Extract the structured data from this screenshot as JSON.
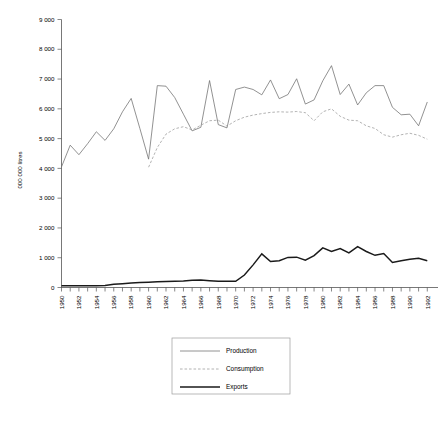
{
  "chart_data": {
    "type": "line",
    "title": "",
    "xlabel": "",
    "ylabel": "000 000 litres",
    "ylim": [
      0,
      9000
    ],
    "xlim": [
      1950,
      1993
    ],
    "grid": false,
    "legend_position": "bottom-center",
    "ytick_labels": [
      "0",
      "1 000",
      "2 000",
      "3 000",
      "4 000",
      "5 000",
      "6 000",
      "7 000",
      "8 000",
      "9 000"
    ],
    "ytick_values": [
      0,
      1000,
      2000,
      3000,
      4000,
      5000,
      6000,
      7000,
      8000,
      9000
    ],
    "xtick_labels": [
      "1950",
      "1951",
      "1952",
      "1953",
      "1954",
      "1955",
      "1956",
      "1957",
      "1958",
      "1959",
      "1960",
      "1961",
      "1962",
      "1963",
      "1964",
      "1965",
      "1966",
      "1967",
      "1968",
      "1969",
      "1970",
      "1971",
      "1972",
      "1973",
      "1974",
      "1975",
      "1976",
      "1977",
      "1978",
      "1979",
      "1980",
      "1981",
      "1982",
      "1983",
      "1984",
      "1985",
      "1986",
      "1987",
      "1988",
      "1989",
      "1990",
      "1991",
      "1992"
    ],
    "xtick_labels_shown": [
      "1950",
      "1952",
      "1954",
      "1956",
      "1958",
      "1960",
      "1962",
      "1964",
      "1966",
      "1968",
      "1970",
      "1972",
      "1974",
      "1976",
      "1978",
      "1980",
      "1982",
      "1984",
      "1986",
      "1988",
      "1990",
      "1992"
    ],
    "x": [
      1950,
      1951,
      1952,
      1953,
      1954,
      1955,
      1956,
      1957,
      1958,
      1959,
      1960,
      1961,
      1962,
      1963,
      1964,
      1965,
      1966,
      1967,
      1968,
      1969,
      1970,
      1971,
      1972,
      1973,
      1974,
      1975,
      1976,
      1977,
      1978,
      1979,
      1980,
      1981,
      1982,
      1983,
      1984,
      1985,
      1986,
      1987,
      1988,
      1989,
      1990,
      1991,
      1992
    ],
    "series": [
      {
        "name": "Production",
        "style": "solid-thin",
        "color": "#6e6e6e",
        "x": [
          1950,
          1951,
          1952,
          1953,
          1954,
          1955,
          1956,
          1957,
          1958,
          1959,
          1960,
          1961,
          1962,
          1963,
          1964,
          1965,
          1966,
          1967,
          1968,
          1969,
          1970,
          1971,
          1972,
          1973,
          1974,
          1975,
          1976,
          1977,
          1978,
          1979,
          1980,
          1981,
          1982,
          1983,
          1984,
          1985,
          1986,
          1987,
          1988,
          1989,
          1990,
          1991,
          1992
        ],
        "values": [
          4050,
          4780,
          4460,
          4830,
          5230,
          4940,
          5330,
          5900,
          6350,
          5340,
          4310,
          6780,
          6760,
          6380,
          5820,
          5260,
          5380,
          6950,
          5470,
          5360,
          6650,
          6730,
          6650,
          6470,
          6970,
          6340,
          6480,
          7010,
          6160,
          6300,
          6940,
          7450,
          6480,
          6830,
          6130,
          6540,
          6780,
          6780,
          6050,
          5800,
          5820,
          5430,
          6230
        ]
      },
      {
        "name": "Consumption",
        "style": "dashed",
        "color": "#9a9a9a",
        "x": [
          1960,
          1961,
          1962,
          1963,
          1964,
          1965,
          1966,
          1967,
          1968,
          1969,
          1970,
          1971,
          1972,
          1973,
          1974,
          1975,
          1976,
          1977,
          1978,
          1979,
          1980,
          1981,
          1982,
          1983,
          1984,
          1985,
          1986,
          1987,
          1988,
          1989,
          1990,
          1991,
          1992
        ],
        "values": [
          4040,
          4700,
          5150,
          5330,
          5400,
          5290,
          5450,
          5600,
          5620,
          5420,
          5600,
          5720,
          5790,
          5840,
          5880,
          5900,
          5890,
          5910,
          5870,
          5600,
          5900,
          6000,
          5750,
          5620,
          5600,
          5430,
          5340,
          5130,
          5050,
          5130,
          5180,
          5110,
          4980
        ]
      },
      {
        "name": "Exports",
        "style": "solid-thick",
        "color": "#1a1a1a",
        "x": [
          1950,
          1951,
          1952,
          1953,
          1954,
          1955,
          1956,
          1957,
          1958,
          1959,
          1960,
          1961,
          1962,
          1963,
          1964,
          1965,
          1966,
          1967,
          1968,
          1969,
          1970,
          1971,
          1972,
          1973,
          1974,
          1975,
          1976,
          1977,
          1978,
          1979,
          1980,
          1981,
          1982,
          1983,
          1984,
          1985,
          1986,
          1987,
          1988,
          1989,
          1990,
          1991,
          1992
        ],
        "values": [
          60,
          60,
          60,
          60,
          60,
          70,
          110,
          130,
          150,
          170,
          180,
          190,
          200,
          210,
          220,
          240,
          250,
          230,
          210,
          210,
          210,
          420,
          760,
          1130,
          870,
          900,
          1010,
          1020,
          920,
          1070,
          1330,
          1210,
          1310,
          1160,
          1370,
          1210,
          1080,
          1140,
          840,
          900,
          950,
          980,
          900
        ]
      }
    ]
  },
  "legend": {
    "items": [
      {
        "label": "Production",
        "style": "solid-thin"
      },
      {
        "label": "Consumption",
        "style": "dashed"
      },
      {
        "label": "Exports",
        "style": "solid-thick"
      }
    ]
  },
  "axes": {
    "y_axis_title": "000 000 litres"
  }
}
